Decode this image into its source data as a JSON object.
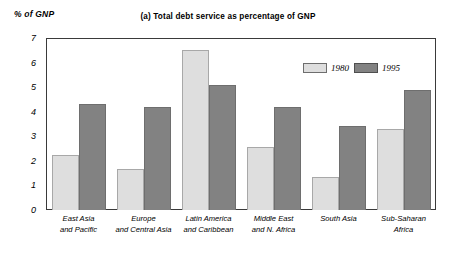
{
  "chart_data": {
    "type": "bar",
    "title": "(a) Total debt service as percentage of GNP",
    "xlabel": "",
    "ylabel": "% of GNP",
    "ylim": [
      0,
      7
    ],
    "yticks": [
      0,
      1,
      2,
      3,
      4,
      5,
      6,
      7
    ],
    "grid": false,
    "legend_position": "inside-top-right",
    "categories": [
      "East Asia\nand Pacific",
      "Europe\nand Central Asia",
      "Latin America\nand Caribbean",
      "Middle East\nand N. Africa",
      "South Asia",
      "Sub-Saharan\nAfrica"
    ],
    "series": [
      {
        "name": "1980",
        "color": "#dedede",
        "values": [
          2.25,
          1.65,
          6.5,
          2.55,
          1.35,
          3.3
        ]
      },
      {
        "name": "1995",
        "color": "#828282",
        "values": [
          4.3,
          4.2,
          5.1,
          4.2,
          3.4,
          4.9
        ]
      }
    ]
  },
  "legend": {
    "entries": [
      {
        "label": "1980"
      },
      {
        "label": "1995"
      }
    ]
  },
  "colors": {
    "series_1980": "#dedede",
    "series_1995": "#828282",
    "frame": "#3a3a3a",
    "background": "#ffffff"
  }
}
